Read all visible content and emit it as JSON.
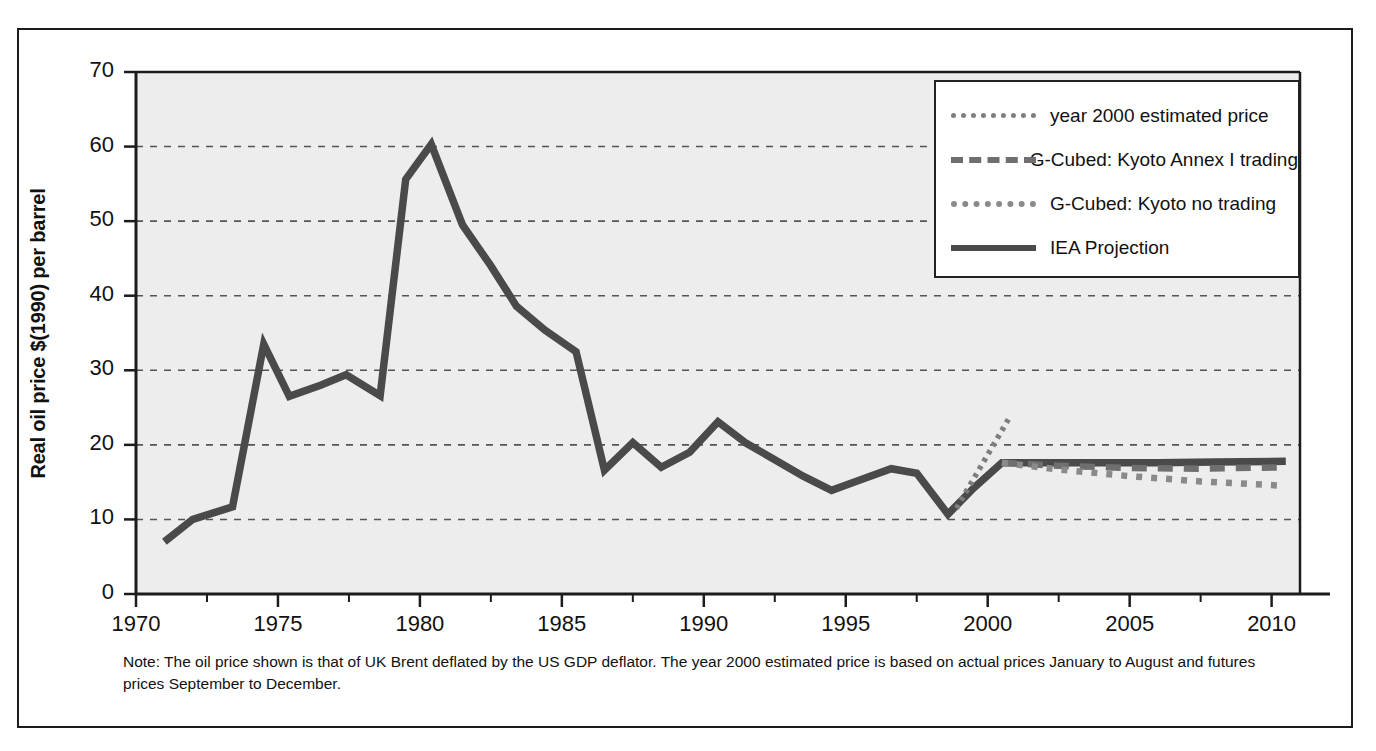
{
  "figure": {
    "note": "Note: The oil price shown is that of UK Brent deflated by the US GDP deflator. The year 2000 estimated price is based on actual prices January to August and futures prices September to December."
  },
  "axes": {
    "ylabel": "Real oil price $(1990) per barrel",
    "xlabel": "",
    "yticks": [
      0,
      10,
      20,
      30,
      40,
      50,
      60,
      70
    ],
    "xticks": [
      1970,
      1975,
      1980,
      1985,
      1990,
      1995,
      2000,
      2005,
      2010
    ],
    "xminor_step": 2.5,
    "xlim": [
      1970,
      2011
    ],
    "ylim": [
      0,
      70
    ],
    "grid": "horizontal dashed"
  },
  "legend": {
    "position": "top-right inside plot",
    "items": [
      {
        "label": "year 2000 estimated price",
        "style": "dotted-fine",
        "color": "#7e7e7e"
      },
      {
        "label": "G-Cubed: Kyoto Annex I trading",
        "style": "dashed",
        "color": "#6f6f6f"
      },
      {
        "label": "G-Cubed: Kyoto no trading",
        "style": "dotted-coarse",
        "color": "#8a8a8a"
      },
      {
        "label": "IEA Projection",
        "style": "solid",
        "color": "#4a4a4a"
      }
    ]
  },
  "colors": {
    "plot_background": "#ededed",
    "axis": "#1c1c1c",
    "grid": "#555555",
    "series_main": "#4a4a4a",
    "series_dashed": "#6f6f6f",
    "series_dotted": "#8a8a8a",
    "page_border": "#1c1c1c"
  },
  "chart_data": {
    "type": "line",
    "title": "",
    "xlabel": "",
    "ylabel": "Real oil price $(1990) per barrel",
    "xlim": [
      1970,
      2011
    ],
    "ylim": [
      0,
      70
    ],
    "grid": true,
    "legend_position": "top-right",
    "series": [
      {
        "name": "IEA Projection",
        "style": "solid",
        "color": "#4a4a4a",
        "x": [
          1971.0,
          1972.0,
          1973.4,
          1974.5,
          1975.4,
          1976.5,
          1977.4,
          1978.6,
          1979.5,
          1980.4,
          1981.5,
          1982.5,
          1983.4,
          1984.4,
          1985.5,
          1986.5,
          1987.5,
          1988.5,
          1989.5,
          1990.5,
          1991.5,
          1992.5,
          1993.5,
          1994.5,
          1995.5,
          1996.6,
          1997.5,
          1998.6,
          1999.5,
          2000.5,
          2002.0,
          2004.0,
          2006.0,
          2008.0,
          2010.5
        ],
        "y": [
          7.0,
          10.0,
          11.7,
          33.5,
          26.5,
          28.0,
          29.4,
          26.6,
          55.6,
          60.3,
          49.5,
          44.0,
          38.6,
          35.4,
          32.5,
          16.6,
          20.3,
          17.0,
          19.0,
          23.1,
          20.2,
          18.0,
          15.8,
          13.9,
          15.3,
          16.8,
          16.2,
          10.7,
          14.2,
          17.6,
          17.6,
          17.6,
          17.6,
          17.7,
          17.8
        ]
      },
      {
        "name": "year 2000 estimated price",
        "style": "dotted-fine",
        "color": "#7e7e7e",
        "x": [
          1998.9,
          2000.8
        ],
        "y": [
          11.5,
          23.9
        ]
      },
      {
        "name": "G-Cubed: Kyoto Annex I trading",
        "style": "dashed",
        "color": "#6f6f6f",
        "x": [
          2000.5,
          2002.5,
          2005.0,
          2007.5,
          2010.5
        ],
        "y": [
          17.6,
          17.2,
          16.9,
          16.8,
          17.0
        ]
      },
      {
        "name": "G-Cubed: Kyoto no trading",
        "style": "dotted-coarse",
        "color": "#8a8a8a",
        "x": [
          2000.5,
          2002.5,
          2005.0,
          2007.5,
          2010.5
        ],
        "y": [
          17.6,
          16.7,
          15.8,
          15.1,
          14.5
        ]
      }
    ]
  }
}
